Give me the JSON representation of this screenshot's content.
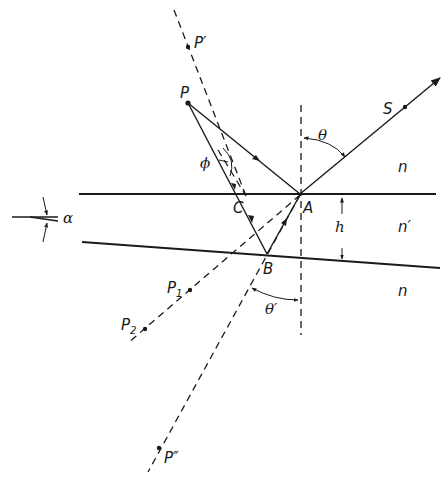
{
  "figure": {
    "labels": {
      "P": "P",
      "P_prime": "P′",
      "P_double_prime": "P″",
      "P1_base": "P",
      "P1_sub": "1",
      "P2_base": "P",
      "P2_sub": "2",
      "S": "S",
      "A": "A",
      "B": "B",
      "C": "C",
      "theta": "θ",
      "theta_prime": "θ′",
      "phi": "ϕ",
      "alpha": "α",
      "h": "h",
      "n_top": "n",
      "n_film": "n′",
      "n_bottom": "n"
    },
    "colors": {
      "ink": "#1a1a1a",
      "background": "#ffffff"
    }
  }
}
